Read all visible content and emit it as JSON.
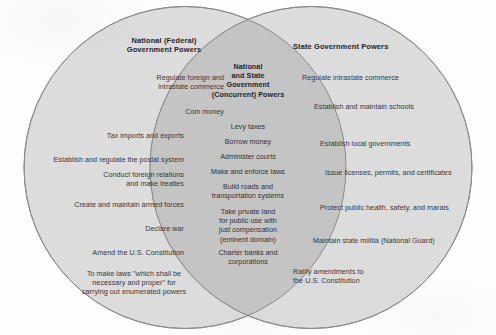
{
  "diagram": {
    "type": "venn",
    "title_left": "National (Federal)\nGovernment Powers",
    "title_center": "National\nand State\nGovernment\n(Concurrent) Powers",
    "title_right": "State Government Powers",
    "colors": {
      "background": "#fdfdfd",
      "circle_fill": "#dcdcdc",
      "overlap_fill": "#c4c4c4",
      "stroke": "#8a8a8a",
      "text": "#33363b",
      "heading_text": "#1f2227"
    },
    "left": {
      "heading": "National (Federal)\nGovernment Powers",
      "items": [
        "Regulate foreign and\nintrastate commerce",
        "Coin money",
        "Tax imports and exports",
        "Establish and regulate the postal system",
        "Conduct foreign relations\nand make treaties",
        "Create and maintain armed forces",
        "Declare war",
        "Amend the U.S. Constitution",
        "To make laws \"which shall be\nnecessary and proper\" for\ncarrying out enumerated powers"
      ]
    },
    "center": {
      "heading": "National\nand State\nGovernment\n(Concurrent) Powers",
      "items": [
        "Levy taxes",
        "Borrow money",
        "Administer courts",
        "Make and enforce laws",
        "Build roads and\ntransportation systems",
        "Take private land\nfor public use with\njust compensation\n(eminent domain)",
        "Charter banks and\ncorporations"
      ]
    },
    "right": {
      "heading": "State Government Powers",
      "items": [
        "Regulate intrastate commerce",
        "Establish and maintain schools",
        "Establish local governments",
        "Issue licenses, permits, and certificates",
        "Protect public health, safety, and marals",
        "Maintain state militia (National Guard)",
        "Ratify amendments to\nthe U.S. Constitution"
      ]
    }
  }
}
